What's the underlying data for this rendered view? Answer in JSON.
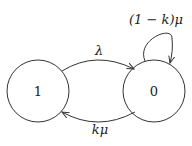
{
  "diagram": {
    "type": "state-transition",
    "nodes": [
      {
        "id": "1",
        "label": "1"
      },
      {
        "id": "0",
        "label": "0"
      }
    ],
    "edges": [
      {
        "from": "1",
        "to": "0",
        "label": "λ"
      },
      {
        "from": "0",
        "to": "1",
        "label": "kμ"
      },
      {
        "from": "0",
        "to": "0",
        "label": "(1 − k)μ"
      }
    ]
  }
}
